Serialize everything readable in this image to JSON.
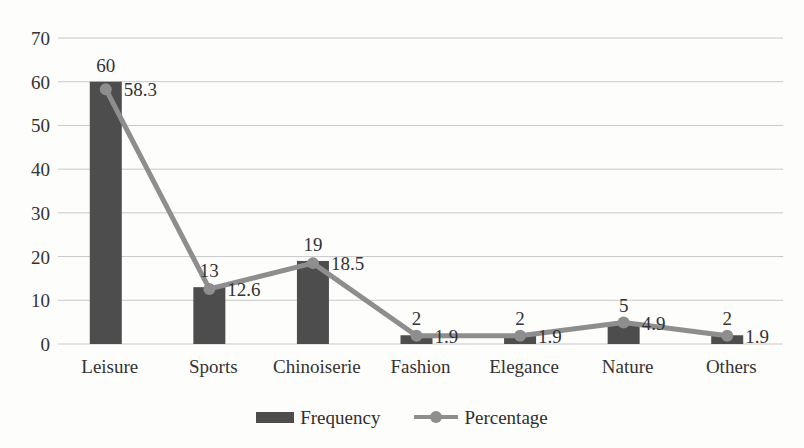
{
  "chart_data": {
    "type": "bar",
    "title": "",
    "subtitle": "",
    "xlabel": "",
    "ylabel": "",
    "ylim": [
      0,
      70
    ],
    "yticks": [
      0,
      10,
      20,
      30,
      40,
      50,
      60,
      70
    ],
    "ytick_labels": [
      "0",
      "10",
      "20",
      "30",
      "40",
      "50",
      "60",
      "70"
    ],
    "grid": true,
    "grid_axis": "y",
    "legend_position": "bottom",
    "categories": [
      "Leisure",
      "Sports",
      "Chinoiserie",
      "Fashion",
      "Elegance",
      "Nature",
      "Others"
    ],
    "series": [
      {
        "name": "Frequency",
        "type": "bar",
        "color": "#4d4d4d",
        "values": [
          60,
          13,
          19,
          2,
          2,
          5,
          2
        ],
        "value_labels": [
          "60",
          "13",
          "19",
          "2",
          "2",
          "5",
          "2"
        ]
      },
      {
        "name": "Percentage",
        "type": "line",
        "color": "#8e8e8e",
        "marker": "circle",
        "values": [
          58.3,
          12.6,
          18.5,
          1.9,
          1.9,
          4.9,
          1.9
        ],
        "value_labels": [
          "58.3",
          "12.6",
          "18.5",
          "1.9",
          "1.9",
          "4.9",
          "1.9"
        ]
      }
    ]
  },
  "legend": {
    "items": [
      {
        "label": "Frequency",
        "icon": "bar-swatch-icon"
      },
      {
        "label": "Percentage",
        "icon": "line-marker-swatch-icon"
      }
    ]
  },
  "colors": {
    "background": "#fdfdfc",
    "bar": "#4d4d4d",
    "line": "#8e8e8e",
    "grid": "#c9c9c9",
    "text": "#2f2f2f"
  }
}
